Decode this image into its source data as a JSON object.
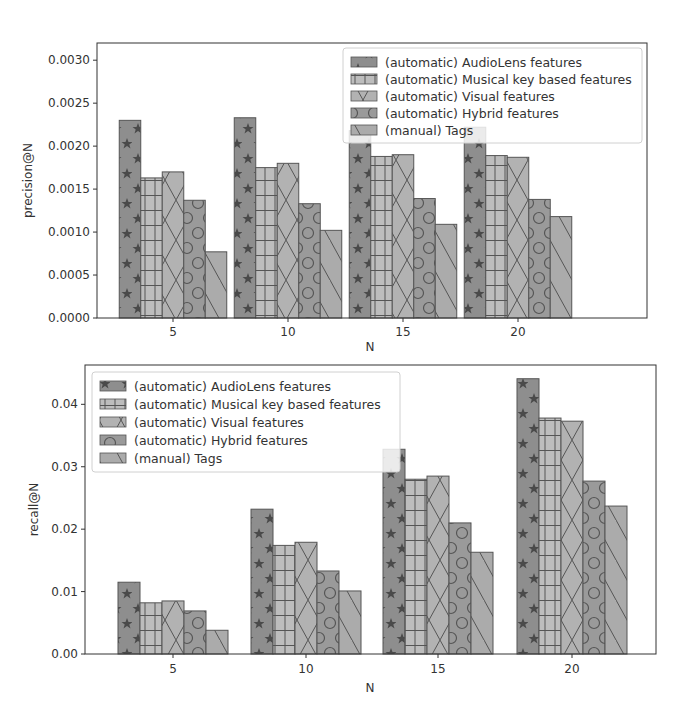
{
  "chart_data": [
    {
      "type": "bar",
      "title": "",
      "xlabel": "N",
      "ylabel": "precision@N",
      "categories": [
        "5",
        "10",
        "15",
        "20"
      ],
      "ylim": [
        0,
        0.0032
      ],
      "yticks": [
        "0.0000",
        "0.0005",
        "0.0010",
        "0.0015",
        "0.0020",
        "0.0025",
        "0.0030"
      ],
      "ytick_values": [
        0,
        0.0005,
        0.001,
        0.0015,
        0.002,
        0.0025,
        0.003
      ],
      "grid": false,
      "legend_position": "upper right",
      "series": [
        {
          "name": "(automatic) AudioLens features",
          "hatch": "stars",
          "values": [
            0.0023,
            0.00233,
            0.00218,
            0.00222
          ]
        },
        {
          "name": "(automatic) Musical key based features",
          "hatch": "grid",
          "values": [
            0.00163,
            0.00175,
            0.00188,
            0.00189
          ]
        },
        {
          "name": "(automatic) Visual features",
          "hatch": "cross",
          "values": [
            0.0017,
            0.0018,
            0.0019,
            0.00187
          ]
        },
        {
          "name": "(automatic) Hybrid features",
          "hatch": "circles",
          "values": [
            0.00137,
            0.00133,
            0.00139,
            0.00138
          ]
        },
        {
          "name": "(manual) Tags",
          "hatch": "backslash",
          "values": [
            0.00077,
            0.00102,
            0.00109,
            0.00118
          ]
        }
      ]
    },
    {
      "type": "bar",
      "title": "",
      "xlabel": "N",
      "ylabel": "recall@N",
      "categories": [
        "5",
        "10",
        "15",
        "20"
      ],
      "ylim": [
        0,
        0.0463
      ],
      "yticks": [
        "0.00",
        "0.01",
        "0.02",
        "0.03",
        "0.04"
      ],
      "ytick_values": [
        0,
        0.01,
        0.02,
        0.03,
        0.04
      ],
      "grid": false,
      "legend_position": "upper left",
      "series": [
        {
          "name": "(automatic) AudioLens features",
          "hatch": "stars",
          "values": [
            0.0115,
            0.0232,
            0.0328,
            0.0441
          ]
        },
        {
          "name": "(automatic) Musical key based features",
          "hatch": "grid",
          "values": [
            0.0082,
            0.0174,
            0.028,
            0.0378
          ]
        },
        {
          "name": "(automatic) Visual features",
          "hatch": "cross",
          "values": [
            0.0085,
            0.0179,
            0.0285,
            0.0373
          ]
        },
        {
          "name": "(automatic) Hybrid features",
          "hatch": "circles",
          "values": [
            0.0069,
            0.0133,
            0.021,
            0.0277
          ]
        },
        {
          "name": "(manual) Tags",
          "hatch": "backslash",
          "values": [
            0.0038,
            0.0101,
            0.0163,
            0.0237
          ]
        }
      ]
    }
  ],
  "colors": {
    "stars": "#8e8e8e",
    "grid": "#bdbdbd",
    "cross": "#b2b2b2",
    "circles": "#9a9a9a",
    "backslash": "#ababab",
    "edge": "#555555",
    "hatch": "#505050"
  }
}
